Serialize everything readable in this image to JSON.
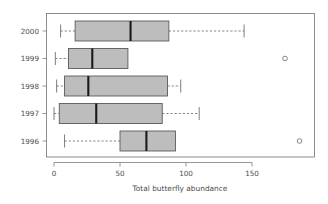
{
  "chart_data": {
    "type": "box",
    "title": "",
    "orientation": "horizontal",
    "xlabel": "Total butterfly abundance",
    "ylabel": "",
    "xlim": [
      -4,
      196
    ],
    "xticks": [
      0,
      50,
      100,
      150
    ],
    "xtick_labels": [
      "0",
      "50",
      "100",
      "150"
    ],
    "categories": [
      "2000",
      "1999",
      "1998",
      "1997",
      "1996"
    ],
    "grid": false,
    "legend": null,
    "box_fill": "#bdbdbd",
    "box_border": "#5a5a5a",
    "median_color": "#1a1a1a",
    "boxes": [
      {
        "category": "2000",
        "whisker_low": 5,
        "q1": 16,
        "median": 58,
        "q3": 87,
        "whisker_high": 144,
        "outliers": []
      },
      {
        "category": "1999",
        "whisker_low": 1,
        "q1": 11,
        "median": 29,
        "q3": 56,
        "whisker_high": 56,
        "outliers": [
          175
        ]
      },
      {
        "category": "1998",
        "whisker_low": 2,
        "q1": 8,
        "median": 26,
        "q3": 86,
        "whisker_high": 96,
        "outliers": []
      },
      {
        "category": "1997",
        "whisker_low": 0,
        "q1": 4,
        "median": 32,
        "q3": 82,
        "whisker_high": 110,
        "outliers": []
      },
      {
        "category": "1996",
        "whisker_low": 8,
        "q1": 50,
        "median": 70,
        "q3": 92,
        "whisker_high": 92,
        "outliers": [
          186
        ]
      }
    ]
  },
  "axis": {
    "x_title": "Total butterfly abundance",
    "tick_0": "0",
    "tick_50": "50",
    "tick_100": "100",
    "tick_150": "150"
  },
  "categories": {
    "c0": "2000",
    "c1": "1999",
    "c2": "1998",
    "c3": "1997",
    "c4": "1996"
  }
}
